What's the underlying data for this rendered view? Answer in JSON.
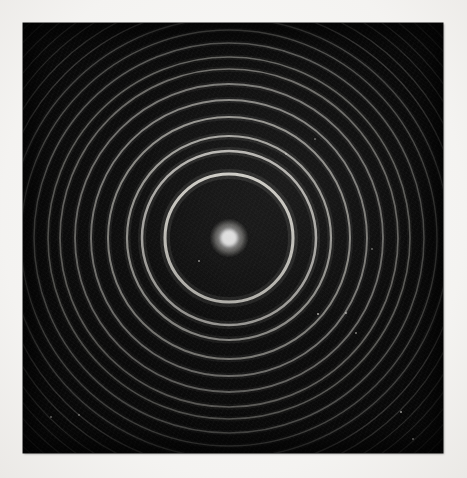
{
  "page": {
    "width": 467,
    "height": 478,
    "background_color": "#f7f6f4",
    "caption": ""
  },
  "photograph": {
    "title": "",
    "plate": {
      "left": 23,
      "top": 23,
      "width": 420,
      "height": 430,
      "background_color": "#090909",
      "emulsion_color": "#121212",
      "description": "Monochrome photographic plate showing a concentric circular fringe pattern with a bright central spot"
    },
    "pattern": {
      "center_x": 206,
      "center_y": 215,
      "ring_color": "#e9e7e0",
      "central_spot": {
        "radius": 8.5,
        "color": "#ffffff",
        "label": "central-maximum"
      }
    },
    "dust_specks": [
      {
        "x": 295,
        "y": 291,
        "size": 2.0,
        "opacity": 0.7
      },
      {
        "x": 323,
        "y": 290,
        "size": 1.6,
        "opacity": 0.55
      },
      {
        "x": 176,
        "y": 238,
        "size": 1.5,
        "opacity": 0.5
      },
      {
        "x": 333,
        "y": 310,
        "size": 1.4,
        "opacity": 0.45
      },
      {
        "x": 378,
        "y": 389,
        "size": 2.4,
        "opacity": 0.62
      },
      {
        "x": 390,
        "y": 416,
        "size": 1.6,
        "opacity": 0.48
      },
      {
        "x": 56,
        "y": 392,
        "size": 2.0,
        "opacity": 0.4
      },
      {
        "x": 28,
        "y": 394,
        "size": 1.3,
        "opacity": 0.35
      },
      {
        "x": 263,
        "y": 131,
        "size": 1.3,
        "opacity": 0.42
      },
      {
        "x": 349,
        "y": 226,
        "size": 1.5,
        "opacity": 0.38
      },
      {
        "x": 292,
        "y": 116,
        "size": 1.2,
        "opacity": 0.34
      }
    ]
  },
  "chart_data": {
    "type": "scatter",
    "xlabel": "",
    "ylabel": "",
    "center": {
      "x": 206,
      "y": 215
    },
    "units": "pixels",
    "ring_order_label": "ring order n",
    "radius_label": "ring radius (px)",
    "rings": [
      {
        "n": 0,
        "radius": 8.5,
        "brightness": 1.0,
        "thickness": 17.0,
        "kind": "central-spot"
      },
      {
        "n": 1,
        "radius": 64,
        "brightness": 0.92,
        "thickness": 3.1,
        "kind": "bright-fringe"
      },
      {
        "n": 2,
        "radius": 87,
        "brightness": 0.78,
        "thickness": 2.5,
        "kind": "bright-fringe"
      },
      {
        "n": 3,
        "radius": 102,
        "brightness": 0.68,
        "thickness": 2.2,
        "kind": "bright-fringe"
      },
      {
        "n": 4,
        "radius": 121,
        "brightness": 0.6,
        "thickness": 2.0,
        "kind": "bright-fringe"
      },
      {
        "n": 5,
        "radius": 138,
        "brightness": 0.54,
        "thickness": 1.9,
        "kind": "bright-fringe"
      },
      {
        "n": 6,
        "radius": 154,
        "brightness": 0.48,
        "thickness": 1.8,
        "kind": "bright-fringe"
      },
      {
        "n": 7,
        "radius": 169,
        "brightness": 0.43,
        "thickness": 1.7,
        "kind": "bright-fringe"
      },
      {
        "n": 8,
        "radius": 181,
        "brightness": 0.39,
        "thickness": 1.6,
        "kind": "bright-fringe"
      },
      {
        "n": 9,
        "radius": 195,
        "brightness": 0.35,
        "thickness": 1.5,
        "kind": "bright-fringe"
      },
      {
        "n": 10,
        "radius": 208,
        "brightness": 0.31,
        "thickness": 1.4,
        "kind": "bright-fringe"
      },
      {
        "n": 11,
        "radius": 220,
        "brightness": 0.27,
        "thickness": 1.4,
        "kind": "bright-fringe"
      },
      {
        "n": 12,
        "radius": 232,
        "brightness": 0.24,
        "thickness": 1.3,
        "kind": "bright-fringe"
      },
      {
        "n": 13,
        "radius": 243,
        "brightness": 0.21,
        "thickness": 1.3,
        "kind": "bright-fringe"
      },
      {
        "n": 14,
        "radius": 254,
        "brightness": 0.18,
        "thickness": 1.2,
        "kind": "bright-fringe"
      },
      {
        "n": 15,
        "radius": 264,
        "brightness": 0.16,
        "thickness": 1.2,
        "kind": "bright-fringe"
      },
      {
        "n": 16,
        "radius": 274,
        "brightness": 0.14,
        "thickness": 1.2,
        "kind": "bright-fringe"
      },
      {
        "n": 17,
        "radius": 284,
        "brightness": 0.12,
        "thickness": 1.1,
        "kind": "bright-fringe"
      },
      {
        "n": 18,
        "radius": 293,
        "brightness": 0.1,
        "thickness": 1.1,
        "kind": "bright-fringe"
      },
      {
        "n": 19,
        "radius": 302,
        "brightness": 0.09,
        "thickness": 1.1,
        "kind": "bright-fringe"
      },
      {
        "n": 20,
        "radius": 311,
        "brightness": 0.08,
        "thickness": 1.0,
        "kind": "bright-fringe"
      }
    ],
    "legend": [],
    "grid": false,
    "annotations": []
  }
}
